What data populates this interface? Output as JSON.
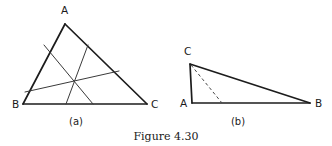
{
  "figure": {
    "caption": "Figure 4.30",
    "panels": [
      {
        "id": "a",
        "label": "(a)",
        "description": "triangle-with-concurrent-cevians",
        "vertices": [
          {
            "name": "A",
            "label": "A",
            "x": 65,
            "y": 24,
            "label_x": 61,
            "label_y": 14
          },
          {
            "name": "B",
            "label": "B",
            "x": 23,
            "y": 104,
            "label_x": 12,
            "label_y": 108
          },
          {
            "name": "C",
            "label": "C",
            "x": 147,
            "y": 104,
            "label_x": 151,
            "label_y": 108
          }
        ],
        "sides": [
          {
            "name": "side-AB",
            "from": "A",
            "to": "B"
          },
          {
            "name": "side-BC",
            "from": "B",
            "to": "C"
          },
          {
            "name": "side-CA",
            "from": "C",
            "to": "A"
          }
        ],
        "cevians": [
          {
            "name": "cevian-from-AB-to-BC",
            "x1": 44,
            "y1": 45,
            "x2": 93,
            "y2": 104
          },
          {
            "name": "cevian-from-AC-to-BC",
            "x1": 88,
            "y1": 45,
            "x2": 66,
            "y2": 104
          },
          {
            "name": "cevian-from-B-to-AC",
            "x1": 25,
            "y1": 92,
            "x2": 119,
            "y2": 71
          }
        ],
        "concurrency_point": {
          "name": "cevian-intersection",
          "x": 73,
          "y": 78
        }
      },
      {
        "id": "b",
        "label": "(b)",
        "description": "obtuse-triangle-with-dashed-altitude",
        "vertices": [
          {
            "name": "A",
            "label": "A",
            "x": 192,
            "y": 103,
            "label_x": 180,
            "label_y": 107
          },
          {
            "name": "B",
            "label": "B",
            "x": 310,
            "y": 103,
            "label_x": 315,
            "label_y": 107
          },
          {
            "name": "C",
            "label": "C",
            "x": 190,
            "y": 64,
            "label_x": 184,
            "label_y": 55
          }
        ],
        "sides": [
          {
            "name": "side-AC",
            "from": "A",
            "to": "C"
          },
          {
            "name": "side-CB",
            "from": "C",
            "to": "B"
          },
          {
            "name": "side-AB",
            "from": "A",
            "to": "B"
          }
        ],
        "altitude": {
          "name": "altitude-from-C",
          "style": "dashed",
          "x1": 191,
          "y1": 65,
          "x2": 222,
          "y2": 103
        }
      }
    ],
    "panel_label_positions": [
      {
        "id": "a",
        "x": 76,
        "y": 125
      },
      {
        "id": "b",
        "x": 238,
        "y": 125
      }
    ],
    "caption_position": {
      "x": 166,
      "y": 140
    },
    "colors": {
      "background": "#ffffff",
      "stroke_outline": "#1c1c1c",
      "stroke_cevian": "#3a3a3a",
      "stroke_dashed": "#4a4a4a",
      "text": "#1a1a1a"
    }
  }
}
